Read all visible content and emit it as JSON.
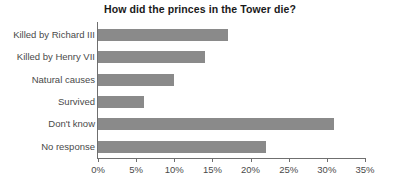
{
  "chart_data": {
    "type": "bar",
    "orientation": "horizontal",
    "title": "How did the princes in the Tower die?",
    "xlabel": "",
    "ylabel": "",
    "categories": [
      "Killed by Richard III",
      "Killed by Henry VII",
      "Natural causes",
      "Survived",
      "Don't know",
      "No response"
    ],
    "values": [
      17,
      14,
      10,
      6,
      31,
      22
    ],
    "value_labels": [
      "17%",
      "14%",
      "10%",
      "6%",
      "31%",
      "22%"
    ],
    "xlim": [
      0,
      35
    ],
    "xticks": [
      0,
      5,
      10,
      15,
      20,
      25,
      30,
      35
    ],
    "xtick_labels": [
      "0%",
      "5%",
      "10%",
      "15%",
      "20%",
      "25%",
      "30%",
      "35%"
    ],
    "grid": false,
    "legend": false,
    "bar_color": "#8a8a8a",
    "axis_color": "#6f6f6f",
    "text_color": "#4a4a4a",
    "title_color": "#1a1a1a",
    "background_color": "#ffffff"
  }
}
